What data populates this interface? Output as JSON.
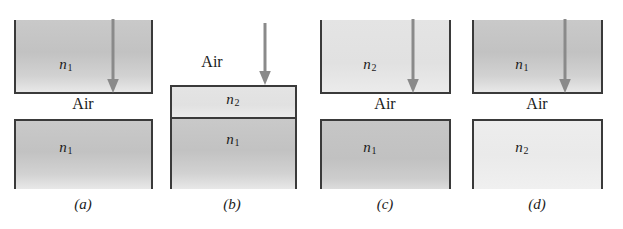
{
  "figure": {
    "background_color": "#ffffff",
    "border_color": "#3a3a3a",
    "colors": {
      "n1_fill": "#c4c4c4",
      "n2_fill": "#e3e3e3",
      "n2_pale_fill": "#ededed",
      "arrow": "#8a8a8a",
      "text": "#1b1b1b"
    }
  },
  "panels": [
    {
      "id": "a",
      "caption": "(a)",
      "gap_label": "Air",
      "top_block": {
        "label": "n",
        "sub": "1",
        "medium": "n1"
      },
      "bottom_block": {
        "label": "n",
        "sub": "1",
        "medium": "n1"
      },
      "arrow": {
        "direction": "down",
        "spans": "top-block"
      }
    },
    {
      "id": "b",
      "caption": "(b)",
      "gap_label": "Air",
      "top_block": {
        "label": "n",
        "sub": "2",
        "medium": "n2"
      },
      "bottom_block": {
        "label": "n",
        "sub": "1",
        "medium": "n1"
      },
      "arrow": {
        "direction": "down",
        "spans": "above-block"
      }
    },
    {
      "id": "c",
      "caption": "(c)",
      "gap_label": "Air",
      "top_block": {
        "label": "n",
        "sub": "2",
        "medium": "n2"
      },
      "bottom_block": {
        "label": "n",
        "sub": "1",
        "medium": "n1"
      },
      "arrow": {
        "direction": "down",
        "spans": "top-block"
      }
    },
    {
      "id": "d",
      "caption": "(d)",
      "gap_label": "Air",
      "top_block": {
        "label": "n",
        "sub": "1",
        "medium": "n1"
      },
      "bottom_block": {
        "label": "n",
        "sub": "2",
        "medium": "n2"
      },
      "arrow": {
        "direction": "down",
        "spans": "top-block"
      }
    }
  ]
}
